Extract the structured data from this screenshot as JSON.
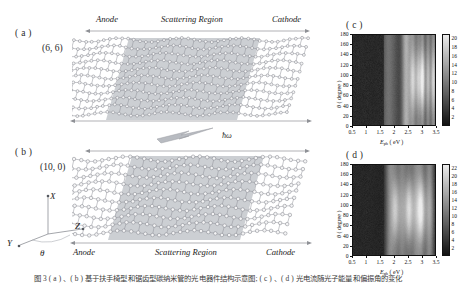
{
  "figure": {
    "panels": {
      "a": {
        "letter": "( a )",
        "chirality": "(6, 6)"
      },
      "b": {
        "letter": "( b )",
        "chirality": "(10, 0)"
      },
      "c": {
        "letter": "( c )"
      },
      "d": {
        "letter": "( d )"
      }
    },
    "region_labels": {
      "anode": "Anode",
      "scattering": "Scattering Region",
      "cathode": "Cathode"
    },
    "photon_label": "ħω",
    "coordinate_axes": {
      "x": "X",
      "y": "Y",
      "z": "Z",
      "theta": "θ"
    },
    "caption": "图 3  ( a ) 、( b ) 基于扶手椅型和锯齿型碳纳米管的光电器件结构示意图; ( c ) 、( d ) 光电流随光子能量和偏振角的变化"
  },
  "chart_data": [
    {
      "id": "c",
      "type": "heatmap",
      "title": "( c )",
      "xlabel": "E_ph (eV)",
      "ylabel": "θ (degree)",
      "xlabel_base": "E",
      "xlabel_sub": "ph",
      "xlabel_unit": "( eV )",
      "ylabel_sym": "θ",
      "ylabel_unit": "( degree )",
      "xlim": [
        0.5,
        3.5
      ],
      "ylim": [
        0,
        180
      ],
      "xticks": [
        0.5,
        1,
        1.5,
        2,
        2.5,
        3,
        3.5
      ],
      "xticklabels": [
        "0.5",
        "1",
        "1.5",
        "2",
        "2.5",
        "3",
        "3.5"
      ],
      "yticks": [
        0,
        20,
        40,
        60,
        80,
        100,
        120,
        140,
        160,
        180
      ],
      "yticklabels": [
        "0",
        "20",
        "40",
        "60",
        "80",
        "100",
        "120",
        "140",
        "160",
        "180"
      ],
      "colorbar": {
        "ticks": [
          2,
          4,
          6,
          8,
          10,
          12,
          14,
          16,
          18,
          20
        ],
        "ticklabels": [
          "2",
          "4",
          "6",
          "8",
          "10",
          "12",
          "14",
          "16",
          "18",
          "20"
        ],
        "vmin": 0,
        "vmax": 21
      },
      "grid": false,
      "legend": "none",
      "bands": [
        {
          "x_center": 0.5,
          "x_width": 1.3,
          "value": 1.0,
          "theta_mod": 0.0
        },
        {
          "x_center": 1.75,
          "x_width": 0.25,
          "value": 5.0,
          "theta_mod": 0.0
        },
        {
          "x_center": 2.0,
          "x_width": 0.3,
          "value": 3.5,
          "theta_mod": 0.0
        },
        {
          "x_center": 2.45,
          "x_width": 0.2,
          "value": 13.0,
          "theta_mod": 0.0
        },
        {
          "x_center": 2.7,
          "x_width": 0.15,
          "value": 16.5,
          "theta_mod": 0.45
        },
        {
          "x_center": 2.9,
          "x_width": 0.12,
          "value": 15.0,
          "theta_mod": 0.5
        },
        {
          "x_center": 3.05,
          "x_width": 0.11,
          "value": 20.0,
          "theta_mod": 0.55
        },
        {
          "x_center": 3.25,
          "x_width": 0.12,
          "value": 14.5,
          "theta_mod": 0.4
        },
        {
          "x_center": 3.45,
          "x_width": 0.12,
          "value": 17.5,
          "theta_mod": 0.45
        }
      ]
    },
    {
      "id": "d",
      "type": "heatmap",
      "title": "( d )",
      "xlabel": "E_ph (eV)",
      "ylabel": "θ (degree)",
      "xlabel_base": "E",
      "xlabel_sub": "ph",
      "xlabel_unit": "( eV )",
      "ylabel_sym": "θ",
      "ylabel_unit": "( degree )",
      "xlim": [
        0.5,
        3.5
      ],
      "ylim": [
        0,
        180
      ],
      "xticks": [
        0.5,
        1,
        1.5,
        2,
        2.5,
        3,
        3.5
      ],
      "xticklabels": [
        "0.5",
        "1",
        "1.5",
        "2",
        "2.5",
        "3",
        "3.5"
      ],
      "yticks": [
        0,
        20,
        40,
        60,
        80,
        100,
        120,
        140,
        160,
        180
      ],
      "yticklabels": [
        "0",
        "20",
        "40",
        "60",
        "80",
        "100",
        "120",
        "140",
        "160",
        "180"
      ],
      "colorbar": {
        "ticks": [
          2,
          4,
          6,
          8,
          10,
          12,
          14,
          16,
          18,
          20,
          22
        ],
        "ticklabels": [
          "2",
          "4",
          "6",
          "8",
          "10",
          "12",
          "14",
          "16",
          "18",
          "20",
          "22"
        ],
        "vmin": 0,
        "vmax": 23
      },
      "grid": false,
      "legend": "none",
      "bands": [
        {
          "x_center": 0.5,
          "x_width": 1.25,
          "value": 1.0,
          "theta_mod": 0.0
        },
        {
          "x_center": 1.85,
          "x_width": 0.2,
          "value": 9.0,
          "theta_mod": 0.0
        },
        {
          "x_center": 2.05,
          "x_width": 0.18,
          "value": 15.0,
          "theta_mod": 0.6
        },
        {
          "x_center": 2.3,
          "x_width": 0.2,
          "value": 12.0,
          "theta_mod": 0.3
        },
        {
          "x_center": 2.55,
          "x_width": 0.18,
          "value": 18.0,
          "theta_mod": 0.65
        },
        {
          "x_center": 2.8,
          "x_width": 0.2,
          "value": 13.0,
          "theta_mod": 0.35
        },
        {
          "x_center": 3.0,
          "x_width": 0.18,
          "value": 20.0,
          "theta_mod": 0.6
        },
        {
          "x_center": 3.3,
          "x_width": 0.2,
          "value": 14.0,
          "theta_mod": 0.3
        }
      ]
    }
  ]
}
